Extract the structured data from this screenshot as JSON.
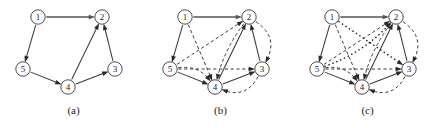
{
  "figure": {
    "background_color": "#ffffff",
    "ink_color": "#3a3a3a",
    "panels": [
      {
        "id": "a",
        "caption": "(a)",
        "nodes": [
          {
            "id": "1",
            "label": "1",
            "x": 38,
            "y": 17
          },
          {
            "id": "2",
            "label": "2",
            "x": 102,
            "y": 17
          },
          {
            "id": "3",
            "label": "3",
            "x": 115,
            "y": 69
          },
          {
            "id": "4",
            "label": "4",
            "x": 68,
            "y": 87
          },
          {
            "id": "5",
            "label": "5",
            "x": 23,
            "y": 69
          }
        ],
        "edges": [
          {
            "from": "1",
            "to": "2",
            "style": "solid-thick",
            "curve": 0
          },
          {
            "from": "1",
            "to": "5",
            "style": "solid",
            "curve": 0
          },
          {
            "from": "5",
            "to": "4",
            "style": "solid",
            "curve": 0
          },
          {
            "from": "4",
            "to": "2",
            "style": "solid",
            "curve": 0
          },
          {
            "from": "4",
            "to": "3",
            "style": "solid",
            "curve": 0
          },
          {
            "from": "3",
            "to": "2",
            "style": "solid",
            "curve": 0
          }
        ]
      },
      {
        "id": "b",
        "caption": "(b)",
        "nodes": [
          {
            "id": "1",
            "label": "1",
            "x": 38,
            "y": 17
          },
          {
            "id": "2",
            "label": "2",
            "x": 102,
            "y": 17
          },
          {
            "id": "3",
            "label": "3",
            "x": 115,
            "y": 69
          },
          {
            "id": "4",
            "label": "4",
            "x": 68,
            "y": 87
          },
          {
            "id": "5",
            "label": "5",
            "x": 23,
            "y": 69
          }
        ],
        "edges": [
          {
            "from": "1",
            "to": "2",
            "style": "solid-thick",
            "curve": 0
          },
          {
            "from": "1",
            "to": "5",
            "style": "solid",
            "curve": 0
          },
          {
            "from": "5",
            "to": "4",
            "style": "solid",
            "curve": 0
          },
          {
            "from": "4",
            "to": "2",
            "style": "solid",
            "curve": 0
          },
          {
            "from": "4",
            "to": "3",
            "style": "solid",
            "curve": 0
          },
          {
            "from": "3",
            "to": "2",
            "style": "solid",
            "curve": 0
          },
          {
            "from": "1",
            "to": "4",
            "style": "dashed",
            "curve": 0
          },
          {
            "from": "5",
            "to": "2",
            "style": "dashed",
            "curve": 0
          },
          {
            "from": "5",
            "to": "3",
            "style": "dashed",
            "curve": 0
          },
          {
            "from": "5",
            "to": "4",
            "style": "dashed",
            "curve": -7
          },
          {
            "from": "3",
            "to": "4",
            "style": "dashed",
            "curve": -11
          },
          {
            "from": "2",
            "to": "3",
            "style": "dashed",
            "curve": -12
          },
          {
            "from": "2",
            "to": "4",
            "style": "dashed",
            "curve": 4
          }
        ]
      },
      {
        "id": "c",
        "caption": "(c)",
        "nodes": [
          {
            "id": "1",
            "label": "1",
            "x": 38,
            "y": 17
          },
          {
            "id": "2",
            "label": "2",
            "x": 102,
            "y": 17
          },
          {
            "id": "3",
            "label": "3",
            "x": 115,
            "y": 69
          },
          {
            "id": "4",
            "label": "4",
            "x": 68,
            "y": 87
          },
          {
            "id": "5",
            "label": "5",
            "x": 23,
            "y": 69
          }
        ],
        "edges": [
          {
            "from": "1",
            "to": "2",
            "style": "solid-thick",
            "curve": 0
          },
          {
            "from": "1",
            "to": "5",
            "style": "solid",
            "curve": 0
          },
          {
            "from": "5",
            "to": "4",
            "style": "solid",
            "curve": 0
          },
          {
            "from": "4",
            "to": "2",
            "style": "solid",
            "curve": 0
          },
          {
            "from": "4",
            "to": "3",
            "style": "solid",
            "curve": 0
          },
          {
            "from": "3",
            "to": "2",
            "style": "solid",
            "curve": 0
          },
          {
            "from": "1",
            "to": "4",
            "style": "dashed",
            "curve": 0
          },
          {
            "from": "5",
            "to": "2",
            "style": "dashed",
            "curve": 0
          },
          {
            "from": "5",
            "to": "3",
            "style": "dashed",
            "curve": 0
          },
          {
            "from": "5",
            "to": "4",
            "style": "dashed",
            "curve": -7
          },
          {
            "from": "3",
            "to": "4",
            "style": "dashed",
            "curve": -11
          },
          {
            "from": "2",
            "to": "3",
            "style": "dashed",
            "curve": -12
          },
          {
            "from": "2",
            "to": "4",
            "style": "dashed",
            "curve": 4
          },
          {
            "from": "1",
            "to": "3",
            "style": "dotted",
            "curve": 0
          },
          {
            "from": "5",
            "to": "2",
            "style": "dotted",
            "curve": 6
          }
        ]
      }
    ]
  }
}
